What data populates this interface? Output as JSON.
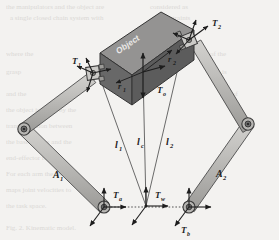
{
  "figure": {
    "background_color": "#f3f2f0",
    "object": {
      "label": "Object",
      "top_face_color": "#8f8f8f",
      "front_face_color": "#5e5e5e",
      "side_face_color": "#6d6d6d",
      "edge_color": "#3a3a3a"
    },
    "links": {
      "color": "#b9b8b5",
      "edge_color": "#4a4a4a",
      "items": [
        {
          "name": "left-lower-link",
          "label": "A",
          "sub": "1"
        },
        {
          "name": "right-lower-link",
          "label": "A",
          "sub": "2"
        }
      ]
    },
    "frames": [
      {
        "name": "left-base-frame",
        "label": "T",
        "sub": "a"
      },
      {
        "name": "center-world-frame",
        "label": "T",
        "sub": "w"
      },
      {
        "name": "right-base-frame",
        "label": "T",
        "sub": "b"
      },
      {
        "name": "left-endeffector-frame",
        "label": "T",
        "sub": "1"
      },
      {
        "name": "right-endeffector-frame",
        "label": "T",
        "sub": "2"
      },
      {
        "name": "object-frame",
        "label": "T",
        "sub": "o"
      }
    ],
    "grasp_vectors": [
      {
        "name": "left-grasp-vector",
        "label": "r",
        "sub": "1"
      },
      {
        "name": "right-grasp-vector",
        "label": "r",
        "sub": "2"
      }
    ],
    "distances": [
      {
        "name": "left-distance",
        "label": "l",
        "sub": "1"
      },
      {
        "name": "center-distance",
        "label": "l",
        "sub": "c"
      },
      {
        "name": "right-distance",
        "label": "l",
        "sub": "2"
      }
    ],
    "arrow_color": "#1d1d1d",
    "guide_line_color": "#6e6e6e",
    "background_text_color": "#d7d5d2"
  }
}
